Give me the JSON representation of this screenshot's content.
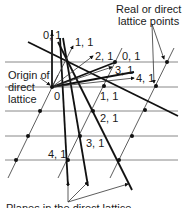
{
  "labels": {
    "origin_title": "Origin of",
    "origin_title2": "direct",
    "origin_title3": "lattice",
    "origin_zero": "0",
    "real_points_line1": "Real or direct",
    "real_points_line2": "lattice points",
    "planes_caption": "Planes in the direct lattice",
    "plane_01": "0, 1",
    "plane_11_top": "1, 1",
    "plane_21_top": "2, 1",
    "plane_01_right": "0, 1",
    "plane_31_top": "3, 1",
    "plane_41_top": "4, 1",
    "plane_11": "1, 1",
    "plane_21": "2, 1",
    "plane_31": "3, 1",
    "plane_41": "4, 1"
  },
  "colors": {
    "line": "#111111",
    "grid": "#7a7a7a",
    "background": "#ffffff"
  }
}
